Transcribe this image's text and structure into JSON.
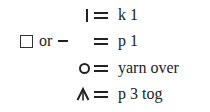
{
  "legend": {
    "rows": [
      {
        "symbol": "vertical-bar",
        "equals": "=",
        "meaning": "k 1"
      },
      {
        "symbol": "square-or-dash",
        "or_text": "or",
        "equals": "=",
        "meaning": "p 1"
      },
      {
        "symbol": "circle",
        "equals": "=",
        "meaning": "yarn over"
      },
      {
        "symbol": "caret-with-stem",
        "equals": "=",
        "meaning": "p 3 tog"
      }
    ]
  }
}
